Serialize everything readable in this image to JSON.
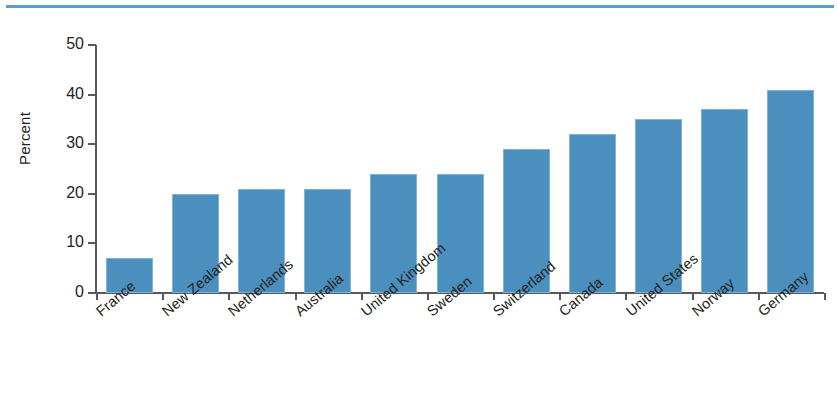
{
  "chart_data": {
    "type": "bar",
    "title": "",
    "subtitle": "",
    "xlabel": "",
    "ylabel": "Percent",
    "ylim": [
      0,
      50
    ],
    "yticks": [
      0,
      10,
      20,
      30,
      40,
      50
    ],
    "grid": false,
    "legend": null,
    "bar_color": "#4A8FBD",
    "accent_rule_color": "#5B9BD0",
    "axis_color": "#58595B",
    "text_color": "#231F20",
    "categories": [
      "France",
      "New Zealand",
      "Netherlands",
      "Australia",
      "United Kingdom",
      "Sweden",
      "Switzerland",
      "Canada",
      "United States",
      "Norway",
      "Germany"
    ],
    "values": [
      7,
      20,
      21,
      21,
      24,
      24,
      29,
      32,
      35,
      37,
      41
    ]
  }
}
